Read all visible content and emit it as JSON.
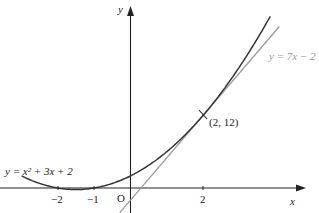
{
  "chart_data": {
    "type": "line",
    "title": "",
    "xlabel": "x",
    "ylabel": "y",
    "origin_label": "O",
    "x_ticks": [
      {
        "value": -2,
        "label": "−2"
      },
      {
        "value": -1,
        "label": "−1"
      },
      {
        "value": 2,
        "label": "2"
      }
    ],
    "series": [
      {
        "name": "y = x² + 3x + 2",
        "kind": "curve",
        "color": "#333333",
        "x_range": [
          -3,
          3.85
        ]
      },
      {
        "name": "y = 7x − 2",
        "kind": "tangent line",
        "color": "#999999",
        "x_range": [
          -0.3,
          4.1
        ]
      }
    ],
    "annotations": [
      {
        "text": "(2, 12)",
        "x": 2,
        "y": 12,
        "marker": "tick"
      }
    ],
    "labels": {
      "curve": "y = x² + 3x + 2",
      "tangent": "y = 7x − 2"
    },
    "grid": false,
    "legend": "none"
  }
}
